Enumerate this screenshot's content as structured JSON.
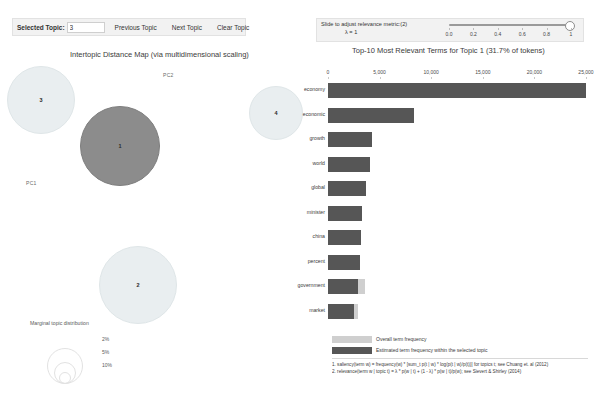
{
  "top_strip": {
    "text": "t2   t3   t4   t5   t6"
  },
  "toolbar_left": {
    "selected_topic_label": "Selected Topic:",
    "selected_topic_value": "3",
    "previous_topic_label": "Previous Topic",
    "next_topic_label": "Next Topic",
    "clear_topic_label": "Clear Topic"
  },
  "toolbar_right": {
    "slider_label": "Slide to adjust relevance metric:(2)",
    "lambda_text": "λ = 1",
    "lambda_value": 1,
    "tick_labels": [
      "0.0",
      "0.2",
      "0.4",
      "0.6",
      "0.8",
      "1"
    ],
    "tick_values": [
      0.0,
      0.2,
      0.4,
      0.6,
      0.8,
      1.0
    ]
  },
  "mds_panel": {
    "title": "Intertopic Distance Map (via multidimensional scaling)",
    "axis_x_label": "PC1",
    "axis_y_label": "PC2",
    "selected_topic": 1,
    "topics": [
      {
        "id": 1,
        "label": "1",
        "cx": 120,
        "cy": 88,
        "r": 40,
        "selected": true
      },
      {
        "id": 2,
        "label": "2",
        "cx": 138,
        "cy": 227,
        "r": 39,
        "selected": false
      },
      {
        "id": 3,
        "label": "3",
        "cx": 41,
        "cy": 42,
        "r": 34,
        "selected": false
      },
      {
        "id": 4,
        "label": "4",
        "cx": 276,
        "cy": 55,
        "r": 27,
        "selected": false
      }
    ],
    "marginal_legend": {
      "title": "Marginal topic distribution",
      "entries": [
        {
          "label": "2%",
          "radius": 5
        },
        {
          "label": "5%",
          "radius": 10
        },
        {
          "label": "10%",
          "radius": 17
        }
      ]
    }
  },
  "bar_panel": {
    "title": "Top-10 Most Relevant Terms for Topic 1 (31.7% of tokens)",
    "legend": {
      "overall_label": "Overall term frequency",
      "topic_label": "Estimated term frequency within the selected topic",
      "overall_color": "#cfcfcf",
      "topic_color": "#565656"
    },
    "footnotes": [
      "1. saliency(term w) = frequency(w) * [sum_t p(t | w) * log(p(t | w)/p(t))] for topics t; see Chuang et. al (2012)",
      "2. relevance(term w | topic t) = λ * p(w | t) + (1 - λ) * p(w | t)/p(w); see Sievert & Shirley (2014)"
    ]
  },
  "chart_data": {
    "type": "bar",
    "title": "Top-10 Most Relevant Terms for Topic 1 (31.7% of tokens)",
    "orientation": "horizontal",
    "categories": [
      "economy",
      "economic",
      "growth",
      "world",
      "global",
      "minister",
      "china",
      "percent",
      "government",
      "market"
    ],
    "series": [
      {
        "name": "Estimated term frequency within the selected topic",
        "color": "#565656",
        "values": [
          25000,
          8300,
          4300,
          4100,
          3700,
          3300,
          3200,
          3100,
          2900,
          2500
        ]
      },
      {
        "name": "Overall term frequency",
        "color": "#cfcfcf",
        "values": [
          25000,
          8300,
          4300,
          4100,
          3700,
          3300,
          3200,
          3100,
          3600,
          2900
        ]
      }
    ],
    "xlabel": "",
    "ylabel": "",
    "xlim": [
      0,
      25000
    ],
    "xticks": [
      0,
      5000,
      10000,
      15000,
      20000,
      25000
    ],
    "xtick_labels": [
      "0",
      "5,000",
      "10,000",
      "15,000",
      "20,000",
      "25,000"
    ],
    "grid": false,
    "legend_position": "bottom-left"
  }
}
